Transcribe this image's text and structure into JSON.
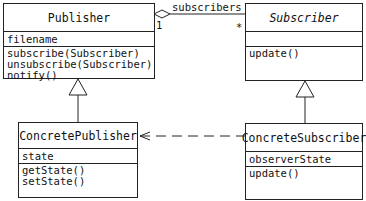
{
  "classes": {
    "publisher": {
      "name": "Publisher",
      "attributes": [
        "filename"
      ],
      "operations": [
        "subscribe(Subscriber)",
        "unsubscribe(Subscriber)",
        "notify()"
      ]
    },
    "subscriber": {
      "name": "Subscriber",
      "attributes": [],
      "operations": [
        "update()"
      ]
    },
    "concrete_publisher": {
      "name": "ConcretePublisher",
      "attributes": [
        "state"
      ],
      "operations": [
        "getState()",
        "setState()"
      ]
    },
    "concrete_subscriber": {
      "name": "ConcreteSubscriber",
      "attributes": [
        "observerState"
      ],
      "operations": [
        "update()"
      ]
    }
  },
  "association": {
    "role": "subscribers",
    "source_multiplicity": "1",
    "target_multiplicity": "*"
  }
}
